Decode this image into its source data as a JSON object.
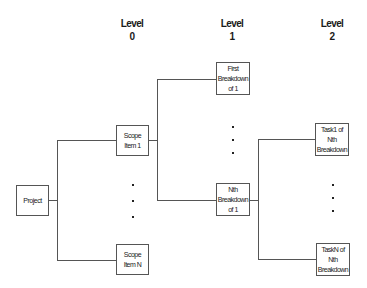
{
  "levels": [
    {
      "label": "Level",
      "number": "0"
    },
    {
      "label": "Level",
      "number": "1"
    },
    {
      "label": "Level",
      "number": "2"
    }
  ],
  "nodes": {
    "project": {
      "lines": [
        "Project"
      ]
    },
    "scope_item_1": {
      "lines": [
        "Scope",
        "Item 1"
      ]
    },
    "scope_item_n": {
      "lines": [
        "Scope",
        "Item N"
      ]
    },
    "first_breakdown": {
      "lines": [
        "First",
        "Breakdown",
        "of 1"
      ]
    },
    "nth_breakdown": {
      "lines": [
        "Nth",
        "Breakdown",
        "of 1"
      ]
    },
    "task1": {
      "lines": [
        "Task1 of",
        "Nth",
        "Breakdown"
      ]
    },
    "taskn": {
      "lines": [
        "TaskN of",
        "Nth",
        "Breakdown"
      ]
    }
  },
  "ellipsis": [
    "·",
    "·",
    "·"
  ],
  "colors": {
    "line": "#555555",
    "text": "#1a1a1a",
    "background": "#ffffff"
  }
}
